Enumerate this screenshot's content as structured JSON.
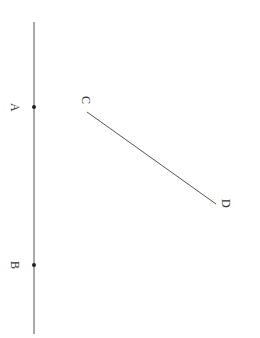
{
  "diagram": {
    "type": "geometry",
    "colors": {
      "line": "#555555",
      "point": "#222222",
      "label": "#333333"
    },
    "line_AB": {
      "x1": 34,
      "y1": 22,
      "x2": 34,
      "y2": 334
    },
    "segment_CD": {
      "x1": 87,
      "y1": 112,
      "x2": 216,
      "y2": 204
    },
    "points": [
      {
        "name": "A",
        "x": 34,
        "y": 107
      },
      {
        "name": "B",
        "x": 34,
        "y": 265
      }
    ],
    "labels": {
      "A": "A",
      "B": "B",
      "C": "C",
      "D": "D"
    }
  }
}
